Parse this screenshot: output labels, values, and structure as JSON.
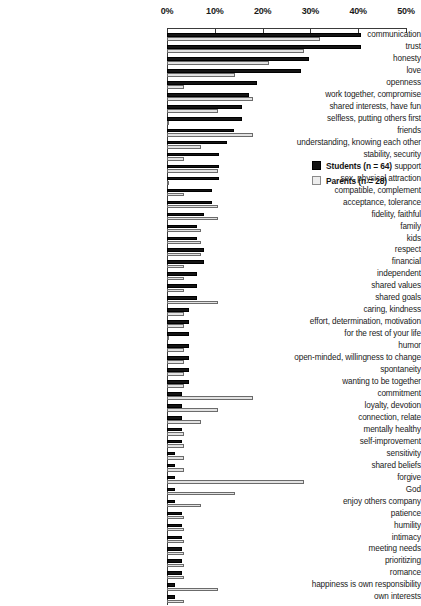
{
  "chart_data": {
    "type": "bar",
    "orientation": "horizontal",
    "title": "",
    "subtitle": "",
    "xlabel": "",
    "ylabel": "",
    "xlim": [
      0,
      50
    ],
    "xunit": "%",
    "xticks": [
      0,
      10,
      20,
      30,
      40,
      50
    ],
    "xtick_labels": [
      "0%",
      "10%",
      "20%",
      "30%",
      "40%",
      "50%"
    ],
    "grid": false,
    "legend_position": "upper-right-inside",
    "axis_position": "top",
    "categories": [
      "communication",
      "trust",
      "honesty",
      "love",
      "openness",
      "work together, compromise",
      "shared interests, have fun",
      "selfless, putting others first",
      "friends",
      "understanding, knowing each other",
      "stability, security",
      "support",
      "sex, physical attraction",
      "compatible, complement",
      "acceptance, tolerance",
      "fidelity, faithful",
      "family",
      "kids",
      "respect",
      "financial",
      "independent",
      "shared values",
      "shared goals",
      "caring, kindness",
      "effort, determination, motivation",
      "for the rest of your life",
      "humor",
      "open-minded, willingness to change",
      "spontaneity",
      "wanting to be together",
      "commitment",
      "loyalty, devotion",
      "connection, relate",
      "mentally healthy",
      "self-improvement",
      "sensitivity",
      "shared beliefs",
      "forgive",
      "God",
      "enjoy others company",
      "patience",
      "humility",
      "intimacy",
      "meeting needs",
      "prioritizing",
      "romance",
      "happiness is own responsibility",
      "own interests"
    ],
    "series": [
      {
        "name": "Students (n = 64)",
        "key": "students",
        "color": "#141414",
        "values": [
          40.6,
          40.6,
          29.7,
          28.1,
          18.8,
          17.2,
          15.6,
          15.6,
          14.1,
          12.5,
          10.9,
          10.9,
          10.9,
          9.4,
          9.4,
          7.8,
          6.3,
          6.3,
          7.8,
          7.8,
          6.3,
          6.3,
          6.3,
          4.7,
          4.7,
          4.7,
          4.7,
          4.7,
          4.7,
          4.7,
          3.1,
          3.1,
          3.1,
          3.1,
          3.1,
          1.6,
          1.6,
          1.6,
          1.6,
          1.6,
          3.1,
          3.1,
          3.1,
          3.1,
          3.1,
          3.1,
          1.6,
          1.6
        ]
      },
      {
        "name": "Parents (n = 28)",
        "key": "parents",
        "color": "#e2e2e2",
        "values": [
          32.1,
          28.6,
          21.4,
          14.3,
          3.6,
          17.9,
          10.7,
          0.0,
          17.9,
          7.1,
          3.6,
          10.7,
          0.0,
          3.6,
          10.7,
          10.7,
          7.1,
          7.1,
          7.1,
          3.6,
          3.6,
          3.6,
          10.7,
          3.6,
          3.6,
          0.0,
          3.6,
          3.6,
          3.6,
          3.6,
          17.9,
          10.7,
          7.1,
          3.6,
          3.6,
          3.6,
          3.6,
          28.6,
          14.3,
          7.1,
          3.6,
          3.6,
          3.6,
          3.6,
          3.6,
          3.6,
          10.7,
          3.6
        ]
      }
    ],
    "legend": [
      {
        "label": "Students (n = 64)",
        "swatch": "students"
      },
      {
        "label": "Parents (n = 28)",
        "swatch": "parents"
      }
    ]
  }
}
